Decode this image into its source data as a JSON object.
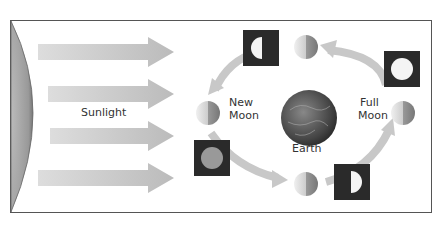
{
  "diagram": {
    "labels": {
      "sunlight": "Sunlight",
      "new_moon_line1": "New",
      "new_moon_line2": "Moon",
      "full_moon_line1": "Full",
      "full_moon_line2": "Moon",
      "earth": "Earth"
    },
    "nodes": [
      {
        "id": "sun",
        "type": "sun-edge"
      },
      {
        "id": "earth",
        "type": "planet"
      },
      {
        "id": "moon-new",
        "position": "left",
        "phase_view": "new"
      },
      {
        "id": "moon-waxing-crescent",
        "position": "lower-left",
        "phase_view": "crescent"
      },
      {
        "id": "moon-first-quarter",
        "position": "bottom",
        "phase_view": "first quarter"
      },
      {
        "id": "moon-full",
        "position": "right",
        "phase_view": "full"
      },
      {
        "id": "moon-last-quarter",
        "position": "top",
        "phase_view": "last quarter"
      }
    ],
    "edges": [
      {
        "from": "sun",
        "to": "earth",
        "label": "Sunlight",
        "count": 4
      },
      {
        "orbit_direction": "counter-clockwise"
      }
    ],
    "colors": {
      "frame": "#555555",
      "arrow": "#c8c8c8",
      "box": "#2a2a2a"
    }
  }
}
